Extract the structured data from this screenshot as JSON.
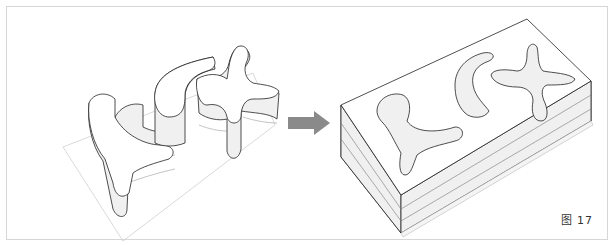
{
  "figure": {
    "label": "图 17",
    "left_model": {
      "description": "extruded freeform walls on ground plane"
    },
    "arrow": {
      "icon": "right-arrow-icon",
      "color": "#8a8a8a"
    },
    "right_model": {
      "description": "solid block with freeform cut-out voids"
    }
  },
  "colors": {
    "frame_border": "#d6d6d6",
    "line": "#222222",
    "hatch": "#9a9a9a",
    "arrow": "#8a8a8a"
  }
}
